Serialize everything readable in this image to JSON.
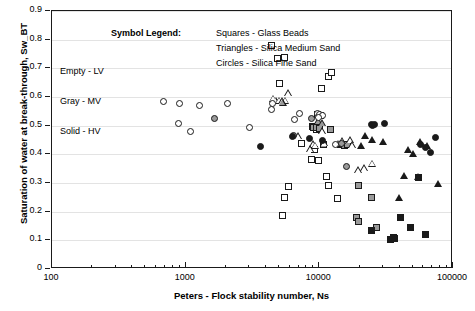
{
  "chart_data": {
    "type": "scatter",
    "title": "",
    "xlabel": "Peters - Flock stability number, Ns",
    "ylabel": "Saturation of water at break-through, Sw_BT",
    "xscale": "log",
    "xlim": [
      100,
      100000
    ],
    "ylim": [
      0,
      0.9
    ],
    "xticks": [
      "100",
      "1000",
      "10000",
      "100000"
    ],
    "xtick_values": [
      100,
      1000,
      10000,
      100000
    ],
    "yticks": [
      "0",
      "0.1",
      "0.2",
      "0.3",
      "0.4",
      "0.5",
      "0.6",
      "0.7",
      "0.8",
      "0.9"
    ],
    "ytick_values": [
      0,
      0.1,
      0.2,
      0.3,
      0.4,
      0.5,
      0.6,
      0.7,
      0.8,
      0.9
    ],
    "grid": true,
    "legend_position": "inside-top-left",
    "legend_title": "Symbol Legend:",
    "shape_legend": [
      "Squares - Glass Beads",
      "Triangles - Silica Medium Sand",
      "Circles - Silica Fine Sand"
    ],
    "fill_legend": [
      "Empty - LV",
      "Gray - MV",
      "Solid - HV"
    ],
    "colors": {
      "empty": "#ffffff",
      "gray": "#9a9a9a",
      "solid": "#1a1a1a",
      "outline": "#1a1a1a",
      "grid": "#e3e3e3",
      "axis": "#1a1a1a"
    },
    "series": [
      {
        "name": "Glass Beads - LV",
        "shape": "square",
        "fill": "empty",
        "points": [
          [
            4400,
            0.781
          ],
          [
            4900,
            0.735
          ],
          [
            5450,
            0.739
          ],
          [
            5050,
            0.646
          ],
          [
            8900,
            0.498
          ],
          [
            9300,
            0.497
          ],
          [
            9600,
            0.487
          ],
          [
            9250,
            0.418
          ],
          [
            8750,
            0.381
          ],
          [
            9850,
            0.38
          ],
          [
            10400,
            0.631
          ],
          [
            11700,
            0.671
          ],
          [
            12400,
            0.686
          ],
          [
            9700,
            0.539
          ],
          [
            10200,
            0.535
          ],
          [
            11400,
            0.322
          ],
          [
            5900,
            0.288
          ],
          [
            5500,
            0.251
          ],
          [
            5300,
            0.188
          ],
          [
            7350,
            0.437
          ],
          [
            11800,
            0.291
          ],
          [
            13650,
            0.246
          ]
        ]
      },
      {
        "name": "Glass Beads - MV",
        "shape": "square",
        "fill": "gray",
        "points": [
          [
            9050,
            0.495
          ],
          [
            9450,
            0.492
          ],
          [
            10100,
            0.489
          ],
          [
            12100,
            0.487
          ],
          [
            10800,
            0.434
          ],
          [
            14400,
            0.433
          ],
          [
            15500,
            0.432
          ],
          [
            16300,
            0.436
          ],
          [
            19500,
            0.29
          ],
          [
            19000,
            0.178
          ],
          [
            19800,
            0.165
          ],
          [
            24600,
            0.25
          ],
          [
            27000,
            0.144
          ]
        ]
      },
      {
        "name": "Glass Beads - HV",
        "shape": "square",
        "fill": "solid",
        "points": [
          [
            24400,
            0.135
          ],
          [
            34000,
            0.104
          ],
          [
            35700,
            0.109
          ],
          [
            36400,
            0.106
          ],
          [
            40500,
            0.181
          ],
          [
            48000,
            0.145
          ],
          [
            55000,
            0.32
          ],
          [
            62000,
            0.121
          ]
        ]
      },
      {
        "name": "Silica Medium Sand - LV",
        "shape": "triangle",
        "fill": "empty",
        "points": [
          [
            4550,
            0.592
          ],
          [
            4750,
            0.585
          ],
          [
            5050,
            0.584
          ],
          [
            5300,
            0.583
          ],
          [
            5600,
            0.585
          ],
          [
            5900,
            0.61
          ],
          [
            7000,
            0.46
          ],
          [
            9000,
            0.432
          ],
          [
            9400,
            0.427
          ],
          [
            10600,
            0.478
          ],
          [
            8550,
            0.416
          ],
          [
            11000,
            0.437
          ],
          [
            13900,
            0.434
          ],
          [
            14900,
            0.444
          ],
          [
            17200,
            0.447
          ],
          [
            19600,
            0.341
          ],
          [
            21800,
            0.349
          ],
          [
            25000,
            0.365
          ],
          [
            17800,
            0.429
          ]
        ]
      },
      {
        "name": "Silica Medium Sand - MV",
        "shape": "triangle",
        "fill": "gray",
        "points": [
          [
            5350,
            0.578
          ],
          [
            9900,
            0.512
          ],
          [
            10600,
            0.505
          ]
        ]
      },
      {
        "name": "Silica Medium Sand - HV",
        "shape": "triangle",
        "fill": "solid",
        "points": [
          [
            20500,
            0.425
          ],
          [
            22000,
            0.462
          ],
          [
            24800,
            0.447
          ],
          [
            30000,
            0.44
          ],
          [
            40000,
            0.246
          ],
          [
            46500,
            0.414
          ],
          [
            50500,
            0.398
          ],
          [
            55500,
            0.318
          ],
          [
            57500,
            0.44
          ],
          [
            65000,
            0.428
          ],
          [
            78000,
            0.295
          ],
          [
            43000,
            0.322
          ]
        ]
      },
      {
        "name": "Silica Fine Sand - LV",
        "shape": "circle",
        "fill": "empty",
        "points": [
          [
            680,
            0.583
          ],
          [
            900,
            0.576
          ],
          [
            880,
            0.508
          ],
          [
            1080,
            0.481
          ],
          [
            1280,
            0.57
          ],
          [
            2050,
            0.579
          ],
          [
            3000,
            0.494
          ],
          [
            4450,
            0.576
          ],
          [
            4400,
            0.557
          ],
          [
            7100,
            0.544
          ],
          [
            6500,
            0.523
          ],
          [
            9700,
            0.543
          ],
          [
            10100,
            0.54
          ],
          [
            10500,
            0.537
          ],
          [
            9800,
            0.53
          ],
          [
            13100,
            0.434
          ]
        ]
      },
      {
        "name": "Silica Fine Sand - MV",
        "shape": "circle",
        "fill": "gray",
        "points": [
          [
            1650,
            0.524
          ],
          [
            6400,
            0.467
          ],
          [
            8800,
            0.524
          ],
          [
            16000,
            0.357
          ],
          [
            14600,
            0.438
          ]
        ]
      },
      {
        "name": "Silica Fine Sand - HV",
        "shape": "circle",
        "fill": "solid",
        "points": [
          [
            3600,
            0.427
          ],
          [
            6250,
            0.463
          ],
          [
            8450,
            0.456
          ],
          [
            10500,
            0.448
          ],
          [
            24500,
            0.503
          ],
          [
            25200,
            0.5
          ],
          [
            26000,
            0.505
          ],
          [
            30500,
            0.508
          ],
          [
            57000,
            0.435
          ],
          [
            62000,
            0.423
          ],
          [
            68000,
            0.408
          ],
          [
            74000,
            0.458
          ]
        ]
      }
    ]
  }
}
